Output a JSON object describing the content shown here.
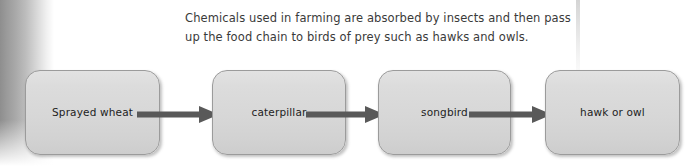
{
  "diagram": {
    "caption": {
      "line1": "Chemicals used in farming are absorbed by insects and then pass",
      "line2": "up the food chain to birds of prey such as hawks and owls."
    },
    "nodes": [
      {
        "id": "sprayed-wheat",
        "label": "Sprayed wheat"
      },
      {
        "id": "caterpillar",
        "label": "caterpillar"
      },
      {
        "id": "songbird",
        "label": "songbird"
      },
      {
        "id": "hawk-or-owl",
        "label": "hawk or owl"
      }
    ],
    "arrows": [
      {
        "from": "sprayed-wheat",
        "to": "caterpillar"
      },
      {
        "from": "caterpillar",
        "to": "songbird"
      },
      {
        "from": "songbird",
        "to": "hawk-or-owl"
      }
    ],
    "colors": {
      "node_fill": "#d7d7d7",
      "node_border": "#9b9b9b",
      "node_text": "#1d1d1d",
      "arrow": "#595959",
      "caption_text": "#3a3a3a",
      "page_background": "#ffffff",
      "spine_shadow": "#8e8e8e"
    }
  }
}
